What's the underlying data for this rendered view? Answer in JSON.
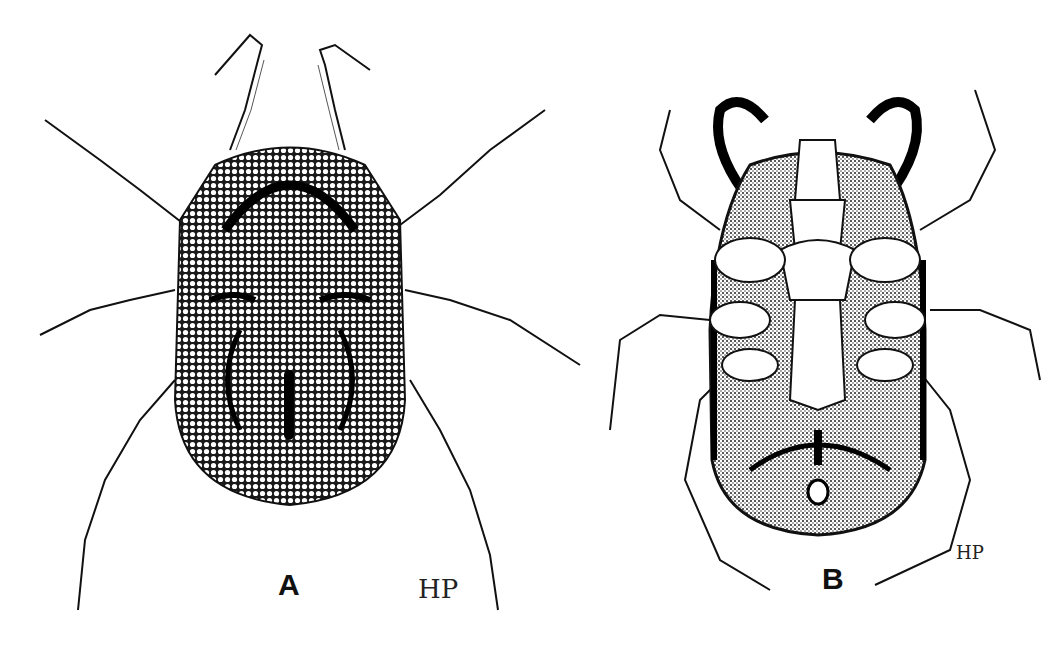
{
  "figure": {
    "panels": [
      {
        "id": "A",
        "label": "A",
        "view": "dorsal",
        "signature": "HP"
      },
      {
        "id": "B",
        "label": "B",
        "view": "ventral",
        "signature": "HP"
      }
    ],
    "colors": {
      "ink": "#111111",
      "paper": "#ffffff",
      "stipple": "#2a2a2a"
    }
  }
}
